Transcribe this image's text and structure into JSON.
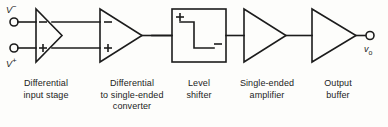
{
  "diagram": {
    "stroke_color": "#1c1c1c",
    "background_color": "#fdfdfb",
    "terminals": {
      "input_minus": {
        "name": "V",
        "sign": "−",
        "icon": "terminal-circle-icon"
      },
      "input_plus": {
        "name": "V",
        "sign": "+",
        "icon": "terminal-circle-icon"
      },
      "output": {
        "name": "v",
        "sub": "o",
        "icon": "terminal-circle-icon"
      }
    },
    "blocks": [
      {
        "id": "differential-input-stage",
        "shape": "triangle-differential-out",
        "label": "Differential\ninput stage",
        "marks": [
          "−",
          "+"
        ]
      },
      {
        "id": "diff-to-single-converter",
        "shape": "triangle",
        "label": "Differential\nto single-ended\nconverter",
        "marks": [
          "−",
          "+"
        ]
      },
      {
        "id": "level-shifter",
        "shape": "box-step",
        "label": "Level\nshifter",
        "marks": [
          "+",
          "−"
        ]
      },
      {
        "id": "single-ended-amplifier",
        "shape": "triangle",
        "label": "Single-ended\namplifier",
        "marks": []
      },
      {
        "id": "output-buffer",
        "shape": "triangle",
        "label": "Output\nbuffer",
        "marks": []
      }
    ]
  }
}
